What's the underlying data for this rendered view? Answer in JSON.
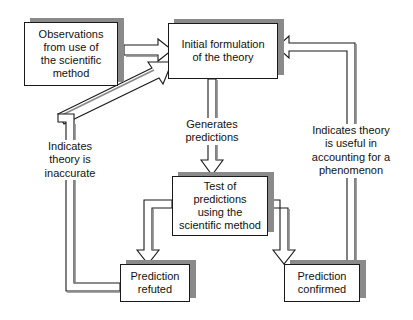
{
  "diagram": {
    "background_color": "#ffffff",
    "line_color": "#1a1a1a",
    "shadow_color": "#8a8a8a",
    "text_color": "#111111",
    "nodes": [
      {
        "id": "observations",
        "label": "Observations\nfrom use of\nthe scientific\nmethod"
      },
      {
        "id": "initial-formulation",
        "label": "Initial formulation\nof the theory"
      },
      {
        "id": "test-of-predictions",
        "label": "Test of\npredictions\nusing the\nscientific method"
      },
      {
        "id": "prediction-refuted",
        "label": "Prediction\nrefuted"
      },
      {
        "id": "prediction-confirmed",
        "label": "Prediction\nconfirmed"
      }
    ],
    "edge_labels": [
      {
        "id": "generates-predictions",
        "label": "Generates\npredictions"
      },
      {
        "id": "indicates-theory-is-inaccurate",
        "label": "Indicates\ntheory is\ninaccurate"
      },
      {
        "id": "indicates-theory-is-useful",
        "label": "Indicates theory\nis useful in\naccounting for a\nphenomenon"
      }
    ]
  }
}
